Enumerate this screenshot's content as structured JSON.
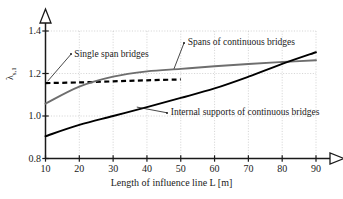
{
  "chart_data": {
    "type": "line",
    "title": "",
    "xlabel": "Length of influence line L [m]",
    "ylabel": "λ",
    "ylabel_sub": "s,1",
    "xlim": [
      10,
      90
    ],
    "ylim": [
      0.8,
      1.4
    ],
    "xticks": [
      10,
      20,
      30,
      40,
      50,
      60,
      70,
      80,
      90
    ],
    "yticks": [
      "0.8",
      "1.0",
      "1.2",
      "1.4"
    ],
    "xtick_labels": [
      "10",
      "20",
      "30",
      "40",
      "50",
      "60",
      "70",
      "80",
      "90"
    ],
    "grid": true,
    "legend": "none",
    "x": [
      10,
      20,
      30,
      40,
      50,
      60,
      70,
      80,
      90
    ],
    "series": [
      {
        "name": "Single span bridges",
        "style": "dashed",
        "color": "#000000",
        "x": [
          10,
          20,
          30,
          40,
          50
        ],
        "values": [
          1.155,
          1.158,
          1.163,
          1.168,
          1.172
        ]
      },
      {
        "name": "Spans of continuous bridges",
        "style": "solid",
        "color": "#6e6e6e",
        "x": [
          10,
          20,
          30,
          40,
          50,
          60,
          70,
          80,
          90
        ],
        "values": [
          1.058,
          1.138,
          1.185,
          1.21,
          1.222,
          1.234,
          1.245,
          1.254,
          1.262
        ]
      },
      {
        "name": "Internal supports of continuous bridges",
        "style": "solid",
        "color": "#000000",
        "x": [
          10,
          20,
          30,
          40,
          50,
          60,
          70,
          80,
          90
        ],
        "values": [
          0.905,
          0.958,
          1.0,
          1.042,
          1.085,
          1.13,
          1.185,
          1.245,
          1.3
        ]
      }
    ],
    "annotations": [
      {
        "text": "Single span bridges",
        "x": 17.5,
        "y": 1.29,
        "leader_to_x": 10.6,
        "leader_to_y": 1.163
      },
      {
        "text": "Spans of continuous bridges",
        "x": 51,
        "y": 1.345,
        "leader_to_x": 48,
        "leader_to_y": 1.222
      },
      {
        "text": "Internal supports of continuous bridges",
        "x": 46,
        "y": 1.015,
        "leader_to_x": 37,
        "leader_to_y": 1.042
      }
    ]
  },
  "axes": {
    "x_arrow": "arrow-right",
    "y_arrow": "arrow-up"
  }
}
